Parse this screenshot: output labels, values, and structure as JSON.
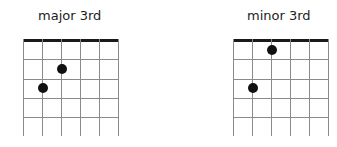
{
  "diagrams": [
    {
      "title": "major 3rd",
      "title_x": 38,
      "origin_x": 23,
      "dots": [
        {
          "string": 2,
          "fret": 2
        },
        {
          "string": 1,
          "fret": 3
        }
      ]
    },
    {
      "title": "minor 3rd",
      "title_x": 247,
      "origin_x": 233,
      "dots": [
        {
          "string": 2,
          "fret": 1
        },
        {
          "string": 1,
          "fret": 3
        }
      ]
    }
  ],
  "grid": {
    "strings": 6,
    "frets_drawn": 4,
    "string_spacing": 19,
    "fret_spacing": 19.3,
    "nut_y": 39,
    "bottom_y": 136,
    "line_color": "#8a8a8a",
    "nut_color": "#1a1a1a",
    "dot_color": "#111111"
  }
}
